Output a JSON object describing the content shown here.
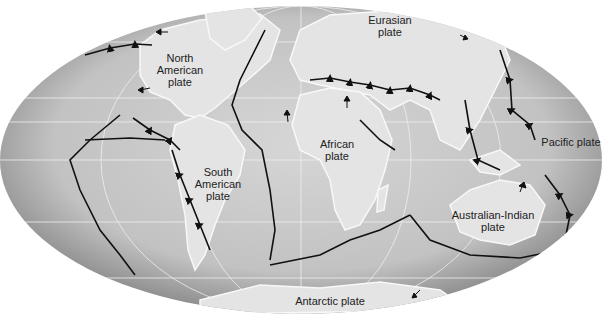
{
  "map": {
    "title": "Tectonic plates world map",
    "projection": "mollweide-ellipse",
    "colors": {
      "ocean_center": "#d4d4d4",
      "ocean_edge": "#9a9a9a",
      "land": "#e6e6e6",
      "boundary": "#111111",
      "grid": "#f4f4f4"
    },
    "plates": [
      {
        "id": "north-american",
        "label": "North\nAmerican\nplate",
        "x": 179,
        "y": 58
      },
      {
        "id": "eurasian",
        "label": "Eurasian\nplate",
        "x": 388,
        "y": 52
      },
      {
        "id": "african",
        "label": "African\nplate",
        "x": 340,
        "y": 138
      },
      {
        "id": "south-american",
        "label": "South\nAmerican\nplate",
        "x": 215,
        "y": 172
      },
      {
        "id": "pacific",
        "label": "Pacific plate",
        "x": 568,
        "y": 142
      },
      {
        "id": "australian-indian",
        "label": "Australian-Indian\nplate",
        "x": 494,
        "y": 214
      },
      {
        "id": "antarctic",
        "label": "Antarctic plate",
        "x": 326,
        "y": 301
      }
    ]
  }
}
